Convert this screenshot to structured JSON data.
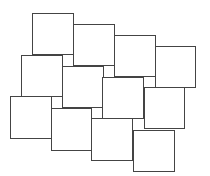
{
  "diagram": {
    "type": "tiling",
    "canvas": {
      "width": 210,
      "height": 176,
      "background": "#ffffff"
    },
    "stroke_color": "#444444",
    "fill_color": "#ffffff",
    "tiles": [
      {
        "id": "r1c1",
        "x": 32,
        "y": 13,
        "w": 42,
        "h": 42
      },
      {
        "id": "r1c2",
        "x": 73,
        "y": 24,
        "w": 42,
        "h": 42
      },
      {
        "id": "r1c3",
        "x": 114,
        "y": 35,
        "w": 42,
        "h": 42
      },
      {
        "id": "r1c4",
        "x": 155,
        "y": 46,
        "w": 41,
        "h": 42
      },
      {
        "id": "r2c1",
        "x": 21,
        "y": 55,
        "w": 42,
        "h": 42
      },
      {
        "id": "r2c2",
        "x": 62,
        "y": 66,
        "w": 42,
        "h": 42
      },
      {
        "id": "r2c3",
        "x": 102,
        "y": 77,
        "w": 42,
        "h": 42
      },
      {
        "id": "r2c4",
        "x": 144,
        "y": 87,
        "w": 41,
        "h": 42
      },
      {
        "id": "r3c1",
        "x": 10,
        "y": 96,
        "w": 42,
        "h": 43
      },
      {
        "id": "r3c2",
        "x": 51,
        "y": 108,
        "w": 41,
        "h": 43
      },
      {
        "id": "r3c3",
        "x": 91,
        "y": 118,
        "w": 42,
        "h": 43
      },
      {
        "id": "r3c4",
        "x": 133,
        "y": 130,
        "w": 42,
        "h": 42
      }
    ]
  }
}
